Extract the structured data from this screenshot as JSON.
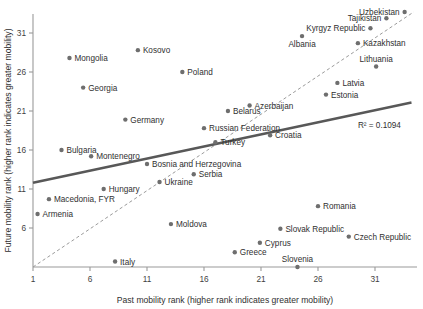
{
  "chart_data": {
    "type": "scatter",
    "title": "",
    "xlabel": "Past mobility rank (higher rank indicates greater mobility)",
    "ylabel": "Future mobility rank (higher rank indicates greater mobility)",
    "xlim": [
      1,
      35
    ],
    "ylim": [
      1,
      34
    ],
    "xticks": [
      1,
      6,
      11,
      16,
      21,
      26,
      31
    ],
    "xticklabels": [
      "1",
      "6",
      "11",
      "16",
      "21",
      "26",
      "31"
    ],
    "yticks": [
      6,
      11,
      16,
      21,
      26,
      31
    ],
    "yticklabels": [
      "6",
      "11",
      "16",
      "21",
      "26",
      "31"
    ],
    "grid": false,
    "legend": null,
    "annotations": [
      {
        "name": "r-squared",
        "text": "R² = 0.1094",
        "x": 29.5,
        "y": 18.8
      }
    ],
    "trendline": {
      "name": "regression-line",
      "style": "solid",
      "color": "#585858",
      "x0": 1.0,
      "y0": 11.8,
      "x1": 34.2,
      "y1": 22.1
    },
    "reference_line": {
      "name": "forty-five-degree-line",
      "style": "dashed",
      "color": "#9b9b9b",
      "x0": 1.0,
      "y0": 1.0,
      "x1": 34.4,
      "y1": 33.7
    },
    "points": [
      {
        "label": "Uzbekistan",
        "x": 33.6,
        "y": 33.7,
        "label_pos": "left"
      },
      {
        "label": "Tajikistan",
        "x": 32.0,
        "y": 32.9,
        "label_pos": "left"
      },
      {
        "label": "Kyrgyz Republic",
        "x": 30.6,
        "y": 31.6,
        "label_pos": "left"
      },
      {
        "label": "Kazakhstan",
        "x": 29.5,
        "y": 29.7,
        "label_pos": "right"
      },
      {
        "label": "Albania",
        "x": 24.6,
        "y": 30.6,
        "label_pos": "below"
      },
      {
        "label": "Lithuania",
        "x": 31.1,
        "y": 26.7,
        "label_pos": "above"
      },
      {
        "label": "Kosovo",
        "x": 10.2,
        "y": 28.8,
        "label_pos": "right"
      },
      {
        "label": "Mongolia",
        "x": 4.2,
        "y": 27.8,
        "label_pos": "right"
      },
      {
        "label": "Poland",
        "x": 14.1,
        "y": 26.0,
        "label_pos": "right"
      },
      {
        "label": "Latvia",
        "x": 27.7,
        "y": 24.6,
        "label_pos": "right"
      },
      {
        "label": "Georgia",
        "x": 5.4,
        "y": 24.0,
        "label_pos": "right"
      },
      {
        "label": "Estonia",
        "x": 26.7,
        "y": 23.1,
        "label_pos": "right"
      },
      {
        "label": "Azerbaijan",
        "x": 20.0,
        "y": 21.7,
        "label_pos": "right"
      },
      {
        "label": "Belarus",
        "x": 18.1,
        "y": 21.0,
        "label_pos": "right"
      },
      {
        "label": "Germany",
        "x": 9.1,
        "y": 19.9,
        "label_pos": "right"
      },
      {
        "label": "Russian Federation",
        "x": 16.0,
        "y": 18.8,
        "label_pos": "right"
      },
      {
        "label": "Croatia",
        "x": 21.8,
        "y": 17.9,
        "label_pos": "right"
      },
      {
        "label": "Turkey",
        "x": 17.0,
        "y": 17.0,
        "label_pos": "right"
      },
      {
        "label": "Bulgaria",
        "x": 3.5,
        "y": 16.0,
        "label_pos": "right"
      },
      {
        "label": "Montenegro",
        "x": 6.1,
        "y": 15.2,
        "label_pos": "right"
      },
      {
        "label": "Bosnia and Herzegovina",
        "x": 11.0,
        "y": 14.2,
        "label_pos": "right"
      },
      {
        "label": "Serbia",
        "x": 15.1,
        "y": 12.9,
        "label_pos": "right"
      },
      {
        "label": "Ukraine",
        "x": 12.1,
        "y": 11.9,
        "label_pos": "right"
      },
      {
        "label": "Hungary",
        "x": 7.2,
        "y": 11.0,
        "label_pos": "right"
      },
      {
        "label": "Macedonia, FYR",
        "x": 2.4,
        "y": 9.7,
        "label_pos": "right"
      },
      {
        "label": "Armenia",
        "x": 1.4,
        "y": 7.8,
        "label_pos": "right"
      },
      {
        "label": "Romania",
        "x": 26.0,
        "y": 8.8,
        "label_pos": "right"
      },
      {
        "label": "Moldova",
        "x": 13.1,
        "y": 6.5,
        "label_pos": "right"
      },
      {
        "label": "Slovak Republic",
        "x": 22.7,
        "y": 5.9,
        "label_pos": "right"
      },
      {
        "label": "Czech Republic",
        "x": 28.7,
        "y": 4.9,
        "label_pos": "right"
      },
      {
        "label": "Cyprus",
        "x": 20.9,
        "y": 4.1,
        "label_pos": "right"
      },
      {
        "label": "Greece",
        "x": 18.7,
        "y": 2.9,
        "label_pos": "right"
      },
      {
        "label": "Slovenia",
        "x": 24.2,
        "y": 1.0,
        "label_pos": "above"
      },
      {
        "label": "Italy",
        "x": 8.2,
        "y": 1.7,
        "label_pos": "right"
      }
    ]
  }
}
